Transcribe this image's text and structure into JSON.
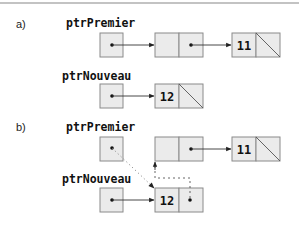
{
  "diagram": {
    "sections": [
      {
        "label": "a)",
        "pointers": [
          {
            "name": "ptrPremier",
            "target": "node-empty"
          },
          {
            "name": "ptrNouveau",
            "target": "node-12"
          }
        ],
        "nodes": [
          {
            "id": "node-empty",
            "value": "",
            "next": "node-11"
          },
          {
            "id": "node-11",
            "value": "11",
            "next": null
          },
          {
            "id": "node-12",
            "value": "12",
            "next": null
          }
        ]
      },
      {
        "label": "b)",
        "pointers": [
          {
            "name": "ptrPremier",
            "target": "node-12",
            "style": "dotted"
          },
          {
            "name": "ptrNouveau",
            "target": "node-12"
          }
        ],
        "nodes": [
          {
            "id": "node-empty",
            "value": "",
            "next": "node-11"
          },
          {
            "id": "node-11",
            "value": "11",
            "next": null
          },
          {
            "id": "node-12",
            "value": "12",
            "next": "node-empty",
            "next_style": "dashed"
          }
        ]
      }
    ]
  },
  "labels": {
    "a": "a)",
    "b": "b)",
    "ptrPremier": "ptrPremier",
    "ptrNouveau": "ptrNouveau",
    "v11": "11",
    "v12": "12"
  }
}
